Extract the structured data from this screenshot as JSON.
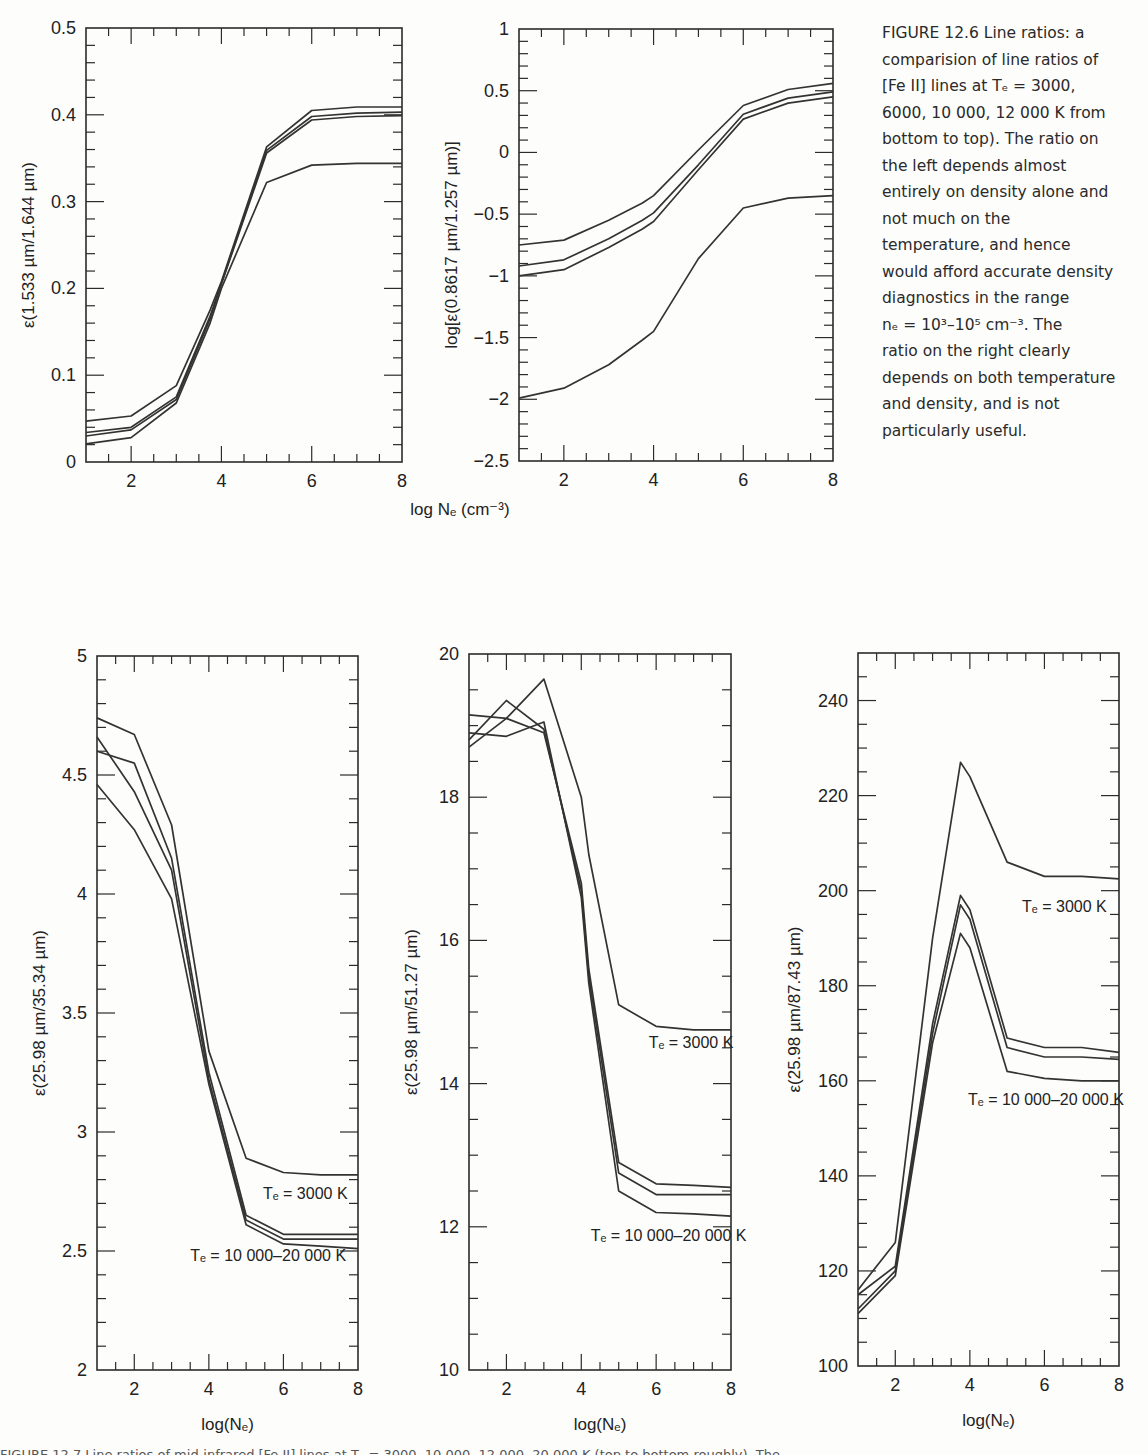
{
  "figure_12_6": {
    "caption_lines": [
      "FIGURE 12.6  Line ratios: a",
      "comparision of line ratios of",
      "[Fe II] lines at Tₑ = 3000,",
      "6000, 10 000, 12 000 K from",
      "bottom to top). The ratio on",
      "the left depends almost",
      "entirely on density alone and",
      "not much on the",
      "temperature, and hence",
      "would afford accurate density",
      "diagnostics in the range",
      "nₑ = 10³–10⁵ cm⁻³. The",
      "ratio on the right clearly",
      "depends on both temperature",
      "and density, and is not",
      "particularly useful."
    ],
    "shared_xlabel": "log Nₑ (cm⁻³)"
  },
  "figure_12_7": {
    "caption_partial": "FIGURE 12.7 Line ratios of mid-infrared [Fe II] lines at Tₑ = 3000, 10 000, 12 000, 20 000 K (top to bottom roughly). The"
  },
  "chart_data": [
    {
      "id": "p1",
      "type": "line",
      "title": "",
      "xlabel": "",
      "ylabel": "ε(1.533 µm/1.644 µm)",
      "xlim": [
        1,
        8
      ],
      "ylim": [
        0,
        0.5
      ],
      "xticks": [
        2,
        4,
        6,
        8
      ],
      "yticks": [
        0,
        0.1,
        0.2,
        0.3,
        0.4,
        0.5
      ],
      "ytick_labels": [
        "0",
        "0.1",
        "0.2",
        "0.3",
        "0.4",
        "0.5"
      ],
      "minor_x": 0.5,
      "minor_y": 0.02,
      "box": [
        86,
        28,
        402,
        462
      ],
      "x": [
        1,
        2,
        3,
        3.75,
        4,
        5,
        6,
        7,
        8
      ],
      "series": [
        {
          "name": "Te=3000 K",
          "values": [
            0.021,
            0.028,
            0.068,
            0.16,
            0.2,
            0.322,
            0.342,
            0.344,
            0.344
          ]
        },
        {
          "name": "Te=6000 K",
          "values": [
            0.03,
            0.037,
            0.072,
            0.165,
            0.205,
            0.356,
            0.394,
            0.398,
            0.399
          ]
        },
        {
          "name": "Te=10000 K",
          "values": [
            0.034,
            0.04,
            0.075,
            0.168,
            0.206,
            0.359,
            0.398,
            0.402,
            0.403
          ]
        },
        {
          "name": "Te=12000 K",
          "values": [
            0.047,
            0.053,
            0.088,
            0.175,
            0.208,
            0.363,
            0.405,
            0.409,
            0.409
          ]
        }
      ]
    },
    {
      "id": "p2",
      "type": "line",
      "title": "",
      "xlabel": "log Nₑ (cm⁻³)",
      "ylabel": "log[ε(0.8617 µm/1.257 µm)]",
      "xlim": [
        1,
        8
      ],
      "ylim": [
        -2.5,
        1
      ],
      "xticks": [
        2,
        4,
        6,
        8
      ],
      "yticks": [
        -2.5,
        -2,
        -1.5,
        -1,
        -0.5,
        0,
        0.5,
        1
      ],
      "ytick_labels": [
        "−2.5",
        "−2",
        "−1.5",
        "−1",
        "−0.5",
        "0",
        "0.5",
        "1"
      ],
      "minor_x": 0.5,
      "minor_y": 0.1,
      "box": [
        519,
        29,
        833,
        461
      ],
      "x": [
        1,
        2,
        3,
        3.75,
        4,
        5,
        6,
        7,
        8
      ],
      "series": [
        {
          "name": "Te=3000 K",
          "values": [
            -1.99,
            -1.91,
            -1.72,
            -1.52,
            -1.45,
            -0.86,
            -0.45,
            -0.37,
            -0.35
          ]
        },
        {
          "name": "Te=6000 K",
          "values": [
            -1.0,
            -0.95,
            -0.77,
            -0.62,
            -0.56,
            -0.14,
            0.27,
            0.4,
            0.45
          ]
        },
        {
          "name": "Te=10000 K",
          "values": [
            -0.92,
            -0.87,
            -0.7,
            -0.55,
            -0.49,
            -0.1,
            0.31,
            0.44,
            0.49
          ]
        },
        {
          "name": "Te=12000 K",
          "values": [
            -0.75,
            -0.71,
            -0.55,
            -0.41,
            -0.35,
            0.02,
            0.38,
            0.51,
            0.56
          ]
        }
      ]
    },
    {
      "id": "p3",
      "type": "line",
      "title": "",
      "xlabel": "log(Nₑ)",
      "ylabel": "ε(25.98 µm/35.34 µm)",
      "xlim": [
        1,
        8
      ],
      "ylim": [
        2,
        5
      ],
      "xticks": [
        2,
        4,
        6,
        8
      ],
      "yticks": [
        2,
        2.5,
        3,
        3.5,
        4,
        4.5,
        5
      ],
      "ytick_labels": [
        "2",
        "2.5",
        "3",
        "3.5",
        "4",
        "4.5",
        "5"
      ],
      "minor_x": 0.5,
      "minor_y": 0.1,
      "box": [
        97,
        656,
        358,
        1370
      ],
      "annotations": [
        {
          "text": "Tₑ = 3000 K",
          "x": 5.45,
          "y": 2.72
        },
        {
          "text": "Tₑ = 10 000–20 000 K",
          "x": 3.5,
          "y": 2.46
        }
      ],
      "x": [
        1,
        2,
        3,
        4,
        5,
        6,
        7,
        8
      ],
      "series": [
        {
          "name": "Te=3000 K",
          "values": [
            4.74,
            4.67,
            4.29,
            3.34,
            2.89,
            2.83,
            2.82,
            2.82
          ]
        },
        {
          "name": "Te=10000 K",
          "values": [
            4.6,
            4.55,
            4.15,
            3.25,
            2.65,
            2.57,
            2.57,
            2.57
          ]
        },
        {
          "name": "Te=12000 K",
          "values": [
            4.66,
            4.43,
            4.1,
            3.22,
            2.63,
            2.55,
            2.55,
            2.55
          ]
        },
        {
          "name": "Te=20000 K",
          "values": [
            4.46,
            4.27,
            3.98,
            3.2,
            2.61,
            2.53,
            2.52,
            2.51
          ]
        }
      ]
    },
    {
      "id": "p4",
      "type": "line",
      "title": "",
      "xlabel": "log(Nₑ)",
      "ylabel": "ε(25.98 µm/51.27 µm)",
      "xlim": [
        1,
        8
      ],
      "ylim": [
        10,
        20
      ],
      "xticks": [
        2,
        4,
        6,
        8
      ],
      "yticks": [
        10,
        12,
        14,
        16,
        18,
        20
      ],
      "ytick_labels": [
        "10",
        "12",
        "14",
        "16",
        "18",
        "20"
      ],
      "minor_x": 0.5,
      "minor_y": 0.5,
      "box": [
        469,
        654,
        731,
        1370
      ],
      "annotations": [
        {
          "text": "Tₑ = 3000 K",
          "x": 5.8,
          "y": 14.5
        },
        {
          "text": "Tₑ = 10 000–20 000 K",
          "x": 4.25,
          "y": 11.8
        }
      ],
      "x": [
        1,
        2,
        3,
        4,
        4.2,
        5,
        6,
        7,
        8
      ],
      "series": [
        {
          "name": "Te=3000 K",
          "values": [
            18.7,
            19.1,
            19.65,
            18.0,
            17.2,
            15.1,
            14.8,
            14.75,
            14.75
          ]
        },
        {
          "name": "Te=10000 K",
          "values": [
            19.15,
            19.1,
            18.9,
            16.8,
            15.6,
            12.9,
            12.6,
            12.58,
            12.55
          ]
        },
        {
          "name": "Te=12000 K",
          "values": [
            18.8,
            19.35,
            18.95,
            16.7,
            15.5,
            12.75,
            12.45,
            12.45,
            12.45
          ]
        },
        {
          "name": "Te=20000 K",
          "values": [
            18.9,
            18.85,
            19.05,
            16.6,
            15.4,
            12.5,
            12.2,
            12.18,
            12.15
          ]
        }
      ]
    },
    {
      "id": "p5",
      "type": "line",
      "title": "",
      "xlabel": "log(Nₑ)",
      "ylabel": "ε(25.98 µm/87.43 µm)",
      "xlim": [
        1,
        8
      ],
      "ylim": [
        100,
        250
      ],
      "xticks": [
        2,
        4,
        6,
        8
      ],
      "yticks": [
        100,
        120,
        140,
        160,
        180,
        200,
        220,
        240
      ],
      "ytick_labels": [
        "100",
        "120",
        "140",
        "160",
        "180",
        "200",
        "220",
        "240"
      ],
      "minor_x": 0.5,
      "minor_y": 5,
      "box": [
        858,
        653,
        1119,
        1366
      ],
      "annotations": [
        {
          "text": "Tₑ = 3000 K",
          "x": 5.4,
          "y": 195.5
        },
        {
          "text": "Tₑ = 10 000–20 000 K",
          "x": 3.95,
          "y": 155
        }
      ],
      "x": [
        1,
        2,
        3,
        3.75,
        4,
        5,
        6,
        7,
        8
      ],
      "series": [
        {
          "name": "Te=3000 K",
          "values": [
            116,
            126,
            190,
            227,
            224,
            206,
            203,
            203,
            202.5
          ]
        },
        {
          "name": "Te=10000 K",
          "values": [
            115,
            121,
            172,
            199,
            196,
            169,
            167,
            167,
            166
          ]
        },
        {
          "name": "Te=12000 K",
          "values": [
            112,
            120,
            170,
            197,
            194,
            167,
            165,
            165,
            164.5
          ]
        },
        {
          "name": "Te=20000 K",
          "values": [
            111,
            119,
            168,
            191,
            188,
            162,
            160.5,
            160,
            160
          ]
        }
      ]
    }
  ]
}
